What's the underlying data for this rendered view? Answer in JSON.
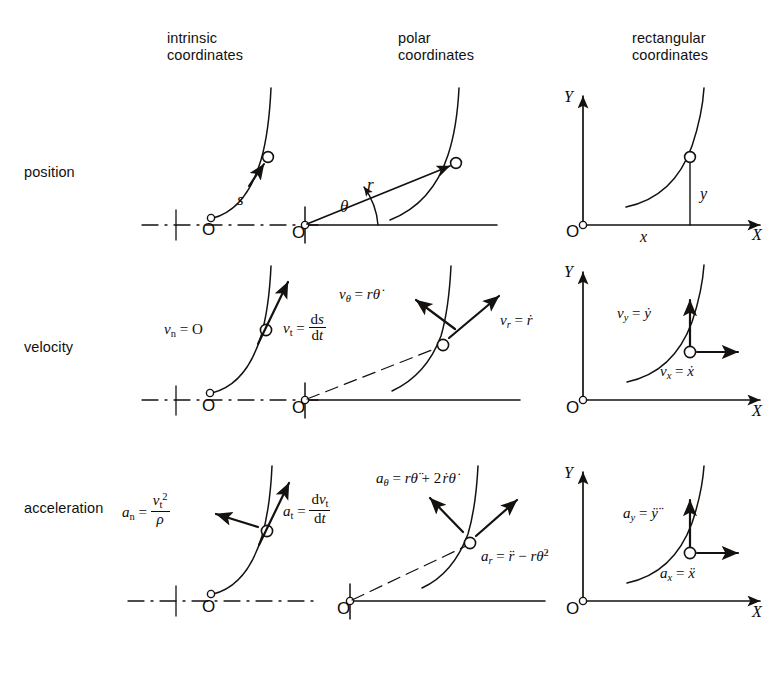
{
  "figure": {
    "type": "diagram",
    "grid": {
      "rows": 3,
      "cols": 3
    }
  },
  "columns": [
    {
      "key": "intrinsic",
      "title": "intrinsic\ncoordinates"
    },
    {
      "key": "polar",
      "title": "polar\ncoordinates"
    },
    {
      "key": "rectangular",
      "title": "rectangular\ncoordinates"
    }
  ],
  "rows": [
    {
      "key": "position",
      "label": "position"
    },
    {
      "key": "velocity",
      "label": "velocity"
    },
    {
      "key": "acceleration",
      "label": "acceleration"
    }
  ],
  "cells": {
    "position_intrinsic": {
      "labels": [
        "s",
        "O"
      ]
    },
    "position_polar": {
      "labels": [
        "r",
        "θ",
        "O"
      ]
    },
    "position_rectangular": {
      "labels": [
        "Y",
        "X",
        "x",
        "y",
        "O"
      ]
    },
    "velocity_intrinsic": {
      "labels": [
        "v_n = O",
        "v_t = ds/dt",
        "O"
      ]
    },
    "velocity_polar": {
      "labels": [
        "v_θ = rθ̇",
        "v_r = ṙ",
        "O"
      ]
    },
    "velocity_rectangular": {
      "labels": [
        "v_y = ẏ",
        "v_x = ẋ",
        "Y",
        "X",
        "O"
      ]
    },
    "acceleration_intrinsic": {
      "labels": [
        "a_n = v_t²/ρ",
        "a_t = dv_t/dt",
        "O"
      ]
    },
    "acceleration_polar": {
      "labels": [
        "a_θ = rθ̈ + 2ṙθ̇",
        "a_r = r̈ − rθ̇²",
        "O"
      ]
    },
    "acceleration_rectangular": {
      "labels": [
        "a_y = ÿ",
        "a_x = ẍ",
        "Y",
        "X",
        "O"
      ]
    }
  },
  "axis_labels": {
    "x": "X",
    "y": "Y",
    "origin": "O"
  },
  "symbols": {
    "arc_length": "s",
    "radius": "r",
    "theta": "θ",
    "rho": "ρ",
    "x": "x",
    "y": "y"
  },
  "colors": {
    "ink": "#14110f",
    "paper": "#ffffff"
  }
}
